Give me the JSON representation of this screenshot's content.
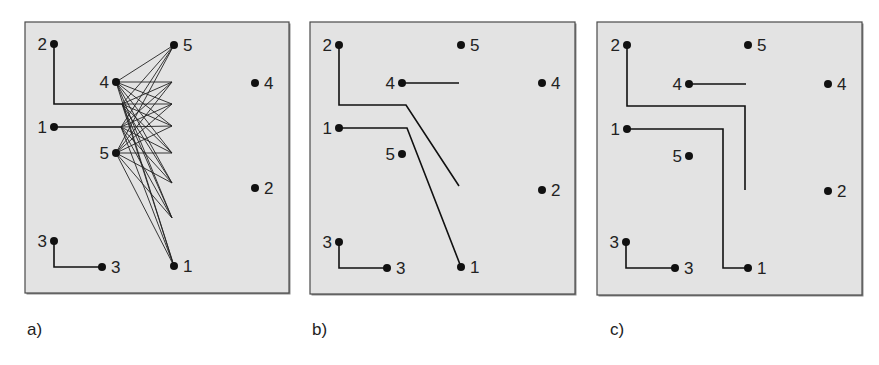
{
  "figure": {
    "background": "#ffffff",
    "panel_fill": "#e3e3e3",
    "panel_border": "#4a4a4a",
    "ink": "#111111"
  },
  "panels": [
    {
      "id": "a",
      "label": "a)",
      "box": {
        "x": 25,
        "y": 22,
        "w": 264,
        "h": 271
      },
      "label_pos": {
        "x": 27,
        "y": 320
      },
      "pins": [
        {
          "text": "2",
          "x": 54,
          "y": 44,
          "side": "left"
        },
        {
          "text": "1",
          "x": 54,
          "y": 127,
          "side": "left"
        },
        {
          "text": "3",
          "x": 54,
          "y": 241,
          "side": "left"
        },
        {
          "text": "3",
          "x": 102,
          "y": 267,
          "side": "right"
        },
        {
          "text": "4",
          "x": 116,
          "y": 82,
          "side": "left"
        },
        {
          "text": "5",
          "x": 116,
          "y": 153,
          "side": "left"
        },
        {
          "text": "5",
          "x": 174,
          "y": 45,
          "side": "right"
        },
        {
          "text": "1",
          "x": 174,
          "y": 266,
          "side": "right"
        },
        {
          "text": "4",
          "x": 255,
          "y": 83,
          "side": "right"
        },
        {
          "text": "2",
          "x": 255,
          "y": 188,
          "side": "right"
        }
      ],
      "wires": [
        [
          [
            54,
            44
          ],
          [
            54,
            104
          ],
          [
            122,
            104
          ]
        ],
        [
          [
            54,
            127
          ],
          [
            121,
            127
          ]
        ],
        [
          [
            54,
            241
          ],
          [
            54,
            267
          ],
          [
            102,
            267
          ]
        ]
      ],
      "fan": {
        "left": [
          [
            116,
            82
          ],
          [
            122,
            104
          ],
          [
            121,
            127
          ],
          [
            116,
            153
          ]
        ],
        "right": [
          [
            174,
            45
          ],
          [
            172,
            82
          ],
          [
            172,
            104
          ],
          [
            172,
            126
          ],
          [
            172,
            153
          ],
          [
            172,
            183
          ],
          [
            172,
            218
          ],
          [
            174,
            266
          ]
        ]
      }
    },
    {
      "id": "b",
      "label": "b)",
      "box": {
        "x": 310,
        "y": 22,
        "w": 265,
        "h": 272
      },
      "label_pos": {
        "x": 312,
        "y": 320
      },
      "pins": [
        {
          "text": "2",
          "x": 339,
          "y": 45,
          "side": "left"
        },
        {
          "text": "1",
          "x": 339,
          "y": 128,
          "side": "left"
        },
        {
          "text": "3",
          "x": 339,
          "y": 242,
          "side": "left"
        },
        {
          "text": "3",
          "x": 387,
          "y": 268,
          "side": "right"
        },
        {
          "text": "4",
          "x": 402,
          "y": 83,
          "side": "left"
        },
        {
          "text": "5",
          "x": 402,
          "y": 154,
          "side": "left"
        },
        {
          "text": "5",
          "x": 461,
          "y": 45,
          "side": "right"
        },
        {
          "text": "1",
          "x": 461,
          "y": 267,
          "side": "right"
        },
        {
          "text": "4",
          "x": 542,
          "y": 83,
          "side": "right"
        },
        {
          "text": "2",
          "x": 542,
          "y": 190,
          "side": "right"
        }
      ],
      "wires": [
        [
          [
            339,
            45
          ],
          [
            339,
            105
          ],
          [
            406,
            105
          ],
          [
            459,
            186
          ]
        ],
        [
          [
            339,
            128
          ],
          [
            407,
            128
          ],
          [
            461,
            267
          ]
        ],
        [
          [
            402,
            83
          ],
          [
            459,
            83
          ]
        ],
        [
          [
            339,
            242
          ],
          [
            339,
            268
          ],
          [
            387,
            268
          ]
        ]
      ]
    },
    {
      "id": "c",
      "label": "c)",
      "box": {
        "x": 597,
        "y": 22,
        "w": 265,
        "h": 273
      },
      "label_pos": {
        "x": 610,
        "y": 320
      },
      "pins": [
        {
          "text": "2",
          "x": 627,
          "y": 45,
          "side": "left"
        },
        {
          "text": "1",
          "x": 627,
          "y": 129,
          "side": "left"
        },
        {
          "text": "3",
          "x": 626,
          "y": 242,
          "side": "left"
        },
        {
          "text": "3",
          "x": 675,
          "y": 268,
          "side": "right"
        },
        {
          "text": "4",
          "x": 689,
          "y": 84,
          "side": "left"
        },
        {
          "text": "5",
          "x": 689,
          "y": 156,
          "side": "left"
        },
        {
          "text": "5",
          "x": 748,
          "y": 45,
          "side": "right"
        },
        {
          "text": "1",
          "x": 748,
          "y": 268,
          "side": "right"
        },
        {
          "text": "4",
          "x": 828,
          "y": 84,
          "side": "right"
        },
        {
          "text": "2",
          "x": 828,
          "y": 191,
          "side": "right"
        }
      ],
      "wires": [
        [
          [
            627,
            45
          ],
          [
            627,
            106
          ],
          [
            745,
            106
          ],
          [
            745,
            190
          ]
        ],
        [
          [
            627,
            129
          ],
          [
            723,
            129
          ],
          [
            723,
            268
          ],
          [
            748,
            268
          ]
        ],
        [
          [
            689,
            84
          ],
          [
            746,
            84
          ]
        ],
        [
          [
            626,
            242
          ],
          [
            626,
            268
          ],
          [
            675,
            268
          ]
        ]
      ]
    }
  ]
}
